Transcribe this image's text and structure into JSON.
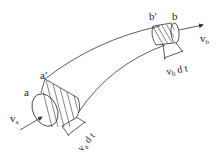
{
  "diagram": {
    "type": "streamtube",
    "labels": {
      "a": "a",
      "a_prime": "a′",
      "b": "b",
      "b_prime": "b′",
      "va": "v",
      "va_sub": "a",
      "vb": "v",
      "vb_sub": "b",
      "va_dt": "v",
      "va_dt_sub": "a",
      "va_dt_rest": " d t",
      "vb_dt": "v",
      "vb_dt_sub": "b",
      "vb_dt_rest": " d t"
    },
    "colors": {
      "stroke": "#333333",
      "text": "#222222",
      "background": "#ffffff"
    }
  }
}
